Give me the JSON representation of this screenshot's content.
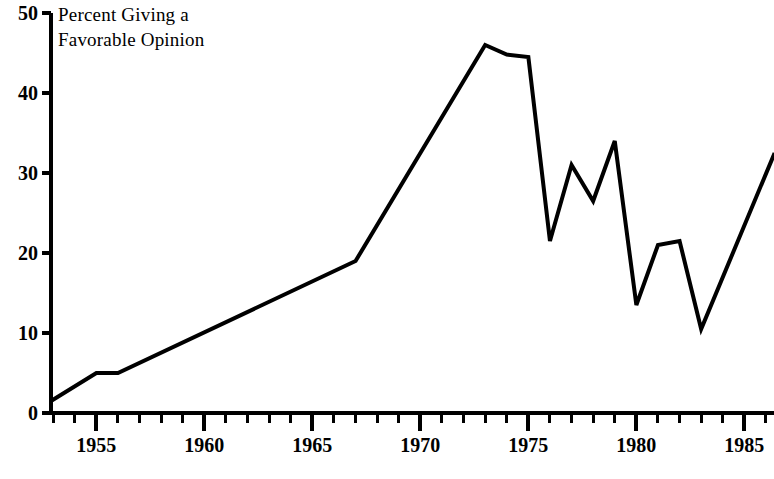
{
  "chart_data": {
    "type": "line",
    "title": "Percent Giving a\nFavorable Opinion",
    "xlabel": "",
    "ylabel": "",
    "xlim": [
      1952.9,
      1986.4
    ],
    "ylim": [
      0,
      50
    ],
    "grid": false,
    "legend": null,
    "y_ticks": [
      0,
      10,
      20,
      30,
      40,
      50
    ],
    "y_tick_labels": [
      "0",
      "10",
      "20",
      "30",
      "40",
      "50"
    ],
    "x_ticks": [
      1955,
      1960,
      1965,
      1970,
      1975,
      1980,
      1985
    ],
    "x_tick_labels": [
      "1955",
      "1960",
      "1965",
      "1970",
      "1975",
      "1980",
      "1985"
    ],
    "x_minor_tick_interval": 1,
    "x": [
      1952.9,
      1955,
      1956,
      1967,
      1973,
      1974,
      1975,
      1976,
      1977,
      1978,
      1979,
      1980,
      1981,
      1982,
      1983,
      1986.4
    ],
    "values": [
      1.5,
      5.0,
      5.0,
      19.0,
      46.0,
      44.8,
      44.5,
      21.5,
      31.0,
      26.5,
      34.0,
      13.5,
      21.0,
      21.5,
      10.5,
      32.5
    ],
    "series": [
      {
        "name": "Percent Giving a Favorable Opinion",
        "color": "#000000",
        "values": [
          1.5,
          5.0,
          5.0,
          19.0,
          46.0,
          44.8,
          44.5,
          21.5,
          31.0,
          26.5,
          34.0,
          13.5,
          21.0,
          21.5,
          10.5,
          32.5
        ]
      }
    ]
  },
  "axis": {
    "line_color": "#000000"
  }
}
